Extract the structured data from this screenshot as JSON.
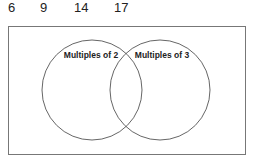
{
  "numbers": [
    "6",
    "9",
    "14",
    "17"
  ],
  "venn": {
    "sets": [
      {
        "label": "Multiples of 2"
      },
      {
        "label": "Multiples of 3"
      }
    ]
  }
}
